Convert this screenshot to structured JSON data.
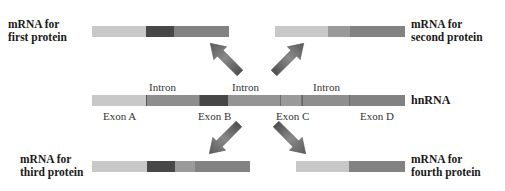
{
  "colors": {
    "exon_a": "#c8c8c8",
    "exon_b": "#474747",
    "exon_c": "#9a9a9a",
    "exon_d": "#828282",
    "intron": "#8e8e8e",
    "arrow": "#6a6a6a"
  },
  "labels": {
    "first_protein": "mRNA for\nfirst protein",
    "second_protein": "mRNA for\nsecond protein",
    "third_protein": "mRNA for\nthird protein",
    "fourth_protein": "mRNA for\nfourth protein",
    "hnrna": "hnRNA",
    "intron_1": "Intron",
    "intron_2": "Intron",
    "intron_3": "Intron",
    "exon_a": "Exon A",
    "exon_b": "Exon B",
    "exon_c": "Exon C",
    "exon_d": "Exon D"
  },
  "mrnas": [
    {
      "name": "first protein",
      "exons": [
        "A",
        "B",
        "D"
      ]
    },
    {
      "name": "second protein",
      "exons": [
        "A",
        "C",
        "D"
      ]
    },
    {
      "name": "third protein",
      "exons": [
        "A",
        "B",
        "C",
        "D"
      ]
    },
    {
      "name": "fourth protein",
      "exons": [
        "A",
        "D"
      ]
    }
  ],
  "hnrna_segments": [
    "Exon A",
    "Intron",
    "Exon B",
    "Intron",
    "Exon C",
    "Intron",
    "Exon D"
  ]
}
